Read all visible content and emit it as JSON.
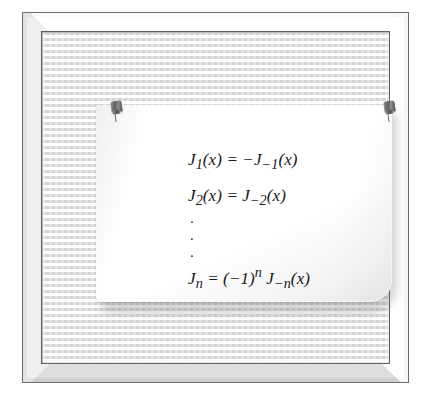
{
  "scene": {
    "title": "Framed bulletin board with pinned note",
    "frame_color": "#e2e2e2",
    "board_color": "#f0f0f0",
    "note_color": "#ffffff",
    "ink_color": "#16181c"
  },
  "pins": [
    {
      "name": "left-pushpin",
      "color": "#5d5d5d"
    },
    {
      "name": "right-pushpin",
      "color": "#5d5d5d"
    }
  ],
  "note": {
    "equations": [
      {
        "id": "eq-1",
        "text": "J₁(x) = −J₋₁(x)"
      },
      {
        "id": "eq-2",
        "text": "J₂(x) = J₋₂(x)"
      },
      {
        "id": "eq-last",
        "text": "Jₙ = (−1)ⁿ J₋ₙ(x)"
      }
    ],
    "ellipsis": {
      "name": "vertical-ellipsis",
      "dots": [
        ".",
        ".",
        "."
      ]
    }
  }
}
